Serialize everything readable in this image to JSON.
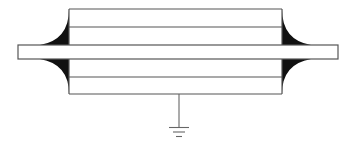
{
  "diagram": {
    "type": "schematic",
    "colors": {
      "background": "#ffffff",
      "stroke": "#555555",
      "fill_flare": "#111111",
      "ground": "#666666"
    },
    "body": {
      "x1": 69,
      "x2": 282,
      "y_top": 9,
      "y_bottom": 94
    },
    "layer_lines_y": [
      9,
      27,
      45,
      59,
      77,
      94
    ],
    "center_bar": {
      "x1": 18,
      "x2": 338,
      "y_top": 45,
      "y_bottom": 59
    },
    "ground": {
      "x": 179,
      "y_start": 94,
      "y_end": 127,
      "bars": [
        {
          "y": 127,
          "half_width": 10
        },
        {
          "y": 132,
          "half_width": 6
        },
        {
          "y": 137,
          "half_width": 3
        }
      ]
    }
  }
}
